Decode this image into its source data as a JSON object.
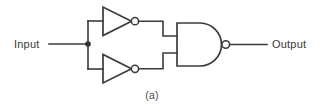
{
  "figure": {
    "caption": "(a)",
    "background_color": "#ffffff",
    "line_color": "#3b3b3b"
  },
  "labels": {
    "input": "Input",
    "output": "Output"
  },
  "circuit": {
    "description": "Two inverters driven from a common input, feeding a two-input NAND gate",
    "components": [
      {
        "name": "inverter-top",
        "type": "NOT",
        "label": ""
      },
      {
        "name": "inverter-bottom",
        "type": "NOT",
        "label": ""
      },
      {
        "name": "nand-gate",
        "type": "NAND",
        "label": ""
      }
    ],
    "nets": [
      {
        "name": "input-net",
        "label": "Input"
      },
      {
        "name": "output-net",
        "label": "Output"
      }
    ]
  }
}
